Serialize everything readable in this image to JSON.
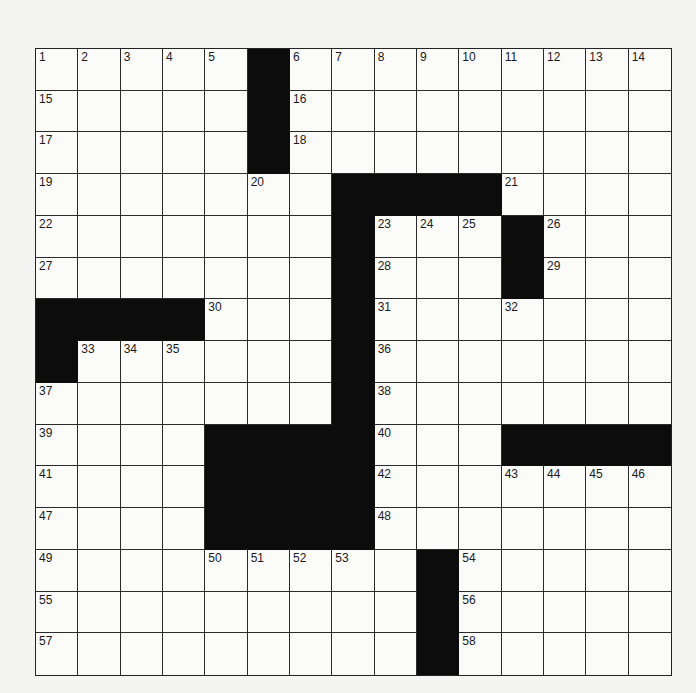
{
  "puzzle": {
    "rows": 15,
    "cols": 15,
    "layout": [
      ".....#.........",
      ".....#.........",
      ".....#.........",
      ".......####....",
      ".......#...#...",
      ".......#...#...",
      "####...#.......",
      "#......#.......",
      ".......#.......",
      "....####...####",
      "....####.......",
      "....####.......",
      ".........#.....",
      ".........#.....",
      ".........#....."
    ],
    "numbers": [
      [
        1,
        2,
        3,
        4,
        5,
        null,
        6,
        7,
        8,
        9,
        10,
        11,
        12,
        13,
        14
      ],
      [
        15,
        null,
        null,
        null,
        null,
        null,
        16,
        null,
        null,
        null,
        null,
        null,
        null,
        null,
        null
      ],
      [
        17,
        null,
        null,
        null,
        null,
        null,
        18,
        null,
        null,
        null,
        null,
        null,
        null,
        null,
        null
      ],
      [
        19,
        null,
        null,
        null,
        null,
        20,
        null,
        null,
        null,
        null,
        null,
        21,
        null,
        null,
        null
      ],
      [
        22,
        null,
        null,
        null,
        null,
        null,
        null,
        null,
        23,
        24,
        25,
        null,
        26,
        null,
        null
      ],
      [
        27,
        null,
        null,
        null,
        null,
        null,
        null,
        null,
        28,
        null,
        null,
        null,
        29,
        null,
        null
      ],
      [
        null,
        null,
        null,
        null,
        30,
        null,
        null,
        null,
        31,
        null,
        null,
        32,
        null,
        null,
        null
      ],
      [
        null,
        33,
        34,
        35,
        null,
        null,
        null,
        null,
        36,
        null,
        null,
        null,
        null,
        null,
        null
      ],
      [
        37,
        null,
        null,
        null,
        null,
        null,
        null,
        null,
        38,
        null,
        null,
        null,
        null,
        null,
        null
      ],
      [
        39,
        null,
        null,
        null,
        null,
        null,
        null,
        null,
        40,
        null,
        null,
        null,
        null,
        null,
        null
      ],
      [
        41,
        null,
        null,
        null,
        null,
        null,
        null,
        null,
        42,
        null,
        null,
        43,
        44,
        45,
        46
      ],
      [
        47,
        null,
        null,
        null,
        null,
        null,
        null,
        null,
        48,
        null,
        null,
        null,
        null,
        null,
        null
      ],
      [
        49,
        null,
        null,
        null,
        50,
        51,
        52,
        53,
        null,
        null,
        54,
        null,
        null,
        null,
        null
      ],
      [
        55,
        null,
        null,
        null,
        null,
        null,
        null,
        null,
        null,
        null,
        56,
        null,
        null,
        null,
        null
      ],
      [
        57,
        null,
        null,
        null,
        null,
        null,
        null,
        null,
        null,
        null,
        58,
        null,
        null,
        null,
        null
      ]
    ],
    "entries": []
  }
}
